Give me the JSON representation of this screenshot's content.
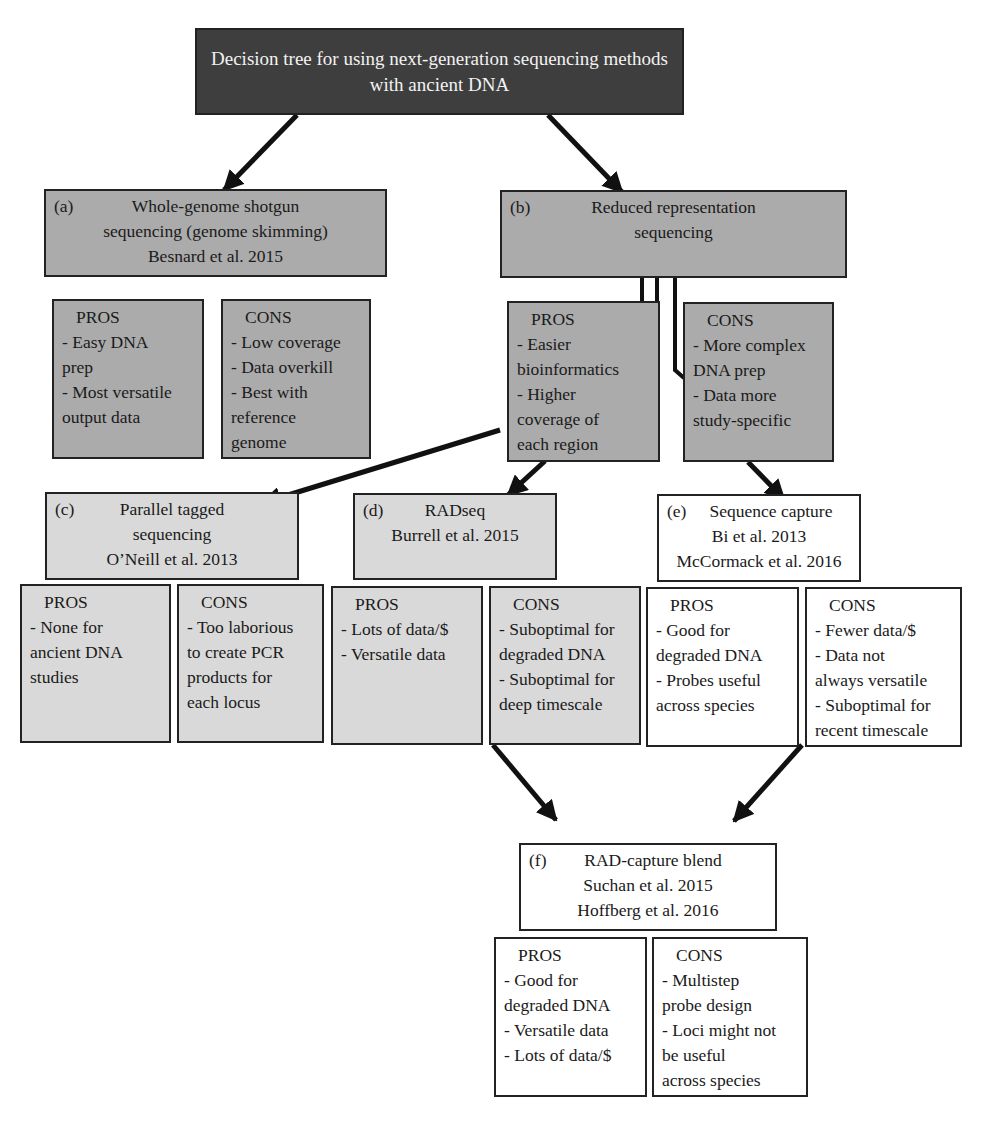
{
  "title": {
    "line1": "Decision tree for using next-generation sequencing methods",
    "line2": "with ancient DNA"
  },
  "colors": {
    "title_bg": "#3e3e3e",
    "level1_bg": "#ababab",
    "level2_bg": "#d9d9d9",
    "level3_bg": "#ffffff",
    "border": "#222222"
  },
  "nodes": {
    "a": {
      "label": "(a)",
      "lines": [
        "Whole-genome shotgun",
        "sequencing (genome skimming)",
        "Besnard et al. 2015"
      ],
      "pros": {
        "heading": "PROS",
        "items": [
          "- Easy DNA",
          "prep",
          "- Most versatile",
          "output data"
        ]
      },
      "cons": {
        "heading": "CONS",
        "items": [
          "- Low coverage",
          "- Data overkill",
          "- Best with",
          "reference",
          "genome"
        ]
      }
    },
    "b": {
      "label": "(b)",
      "lines": [
        "Reduced representation",
        "sequencing"
      ],
      "pros": {
        "heading": "PROS",
        "items": [
          "- Easier",
          "bioinformatics",
          "- Higher",
          "coverage of",
          "each region"
        ]
      },
      "cons": {
        "heading": "CONS",
        "items": [
          "- More complex",
          "DNA prep",
          "- Data more",
          "study-specific"
        ]
      }
    },
    "c": {
      "label": "(c)",
      "lines": [
        "Parallel tagged",
        "sequencing",
        "O’Neill et al. 2013"
      ],
      "pros": {
        "heading": "PROS",
        "items": [
          "- None for",
          "ancient DNA",
          "studies"
        ]
      },
      "cons": {
        "heading": "CONS",
        "items": [
          "- Too laborious",
          "to create PCR",
          "products for",
          "each locus"
        ]
      }
    },
    "d": {
      "label": "(d)",
      "lines": [
        "RADseq",
        "Burrell et al. 2015"
      ],
      "pros": {
        "heading": "PROS",
        "items": [
          "- Lots of data/$",
          "- Versatile data"
        ]
      },
      "cons": {
        "heading": "CONS",
        "items": [
          "- Suboptimal for",
          "degraded DNA",
          "- Suboptimal for",
          "deep timescale"
        ]
      }
    },
    "e": {
      "label": "(e)",
      "lines": [
        "Sequence capture",
        "Bi et al. 2013",
        "McCormack et al. 2016"
      ],
      "pros": {
        "heading": "PROS",
        "items": [
          "- Good for",
          "degraded DNA",
          "- Probes useful",
          "across species"
        ]
      },
      "cons": {
        "heading": "CONS",
        "items": [
          "- Fewer data/$",
          "- Data not",
          "always versatile",
          "- Suboptimal for",
          "recent timescale"
        ]
      }
    },
    "f": {
      "label": "(f)",
      "lines": [
        "RAD-capture blend",
        "Suchan et al. 2015",
        "Hoffberg et al. 2016"
      ],
      "pros": {
        "heading": "PROS",
        "items": [
          "- Good for",
          "degraded DNA",
          "- Versatile data",
          "- Lots of data/$"
        ]
      },
      "cons": {
        "heading": "CONS",
        "items": [
          "- Multistep",
          "probe design",
          "- Loci might not",
          "be useful",
          "across species"
        ]
      }
    }
  }
}
